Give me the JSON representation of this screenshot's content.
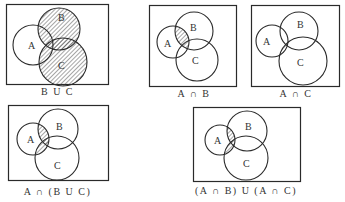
{
  "colors": {
    "stroke": "#2a2a2a",
    "hatch": "#3a3a3a",
    "background": "#ffffff"
  },
  "set_labels": {
    "a": "A",
    "b": "B",
    "c": "C"
  },
  "panels": [
    {
      "id": "b-union-c",
      "caption": "B U C",
      "shaded": "B ∪ C"
    },
    {
      "id": "a-intersect-b",
      "caption": "A ∩ B",
      "shaded": "A ∩ B"
    },
    {
      "id": "a-intersect-c",
      "caption": "A ∩ C",
      "shaded": "A ∩ C"
    },
    {
      "id": "a-intersect-b-union-c",
      "caption": "A ∩ (B U C)",
      "shaded": "A ∩ (B ∪ C)"
    },
    {
      "id": "ab-union-ac",
      "caption": "(A ∩ B) U (A ∩ C)",
      "shaded": "(A ∩ B) ∪ (A ∩ C)"
    }
  ]
}
